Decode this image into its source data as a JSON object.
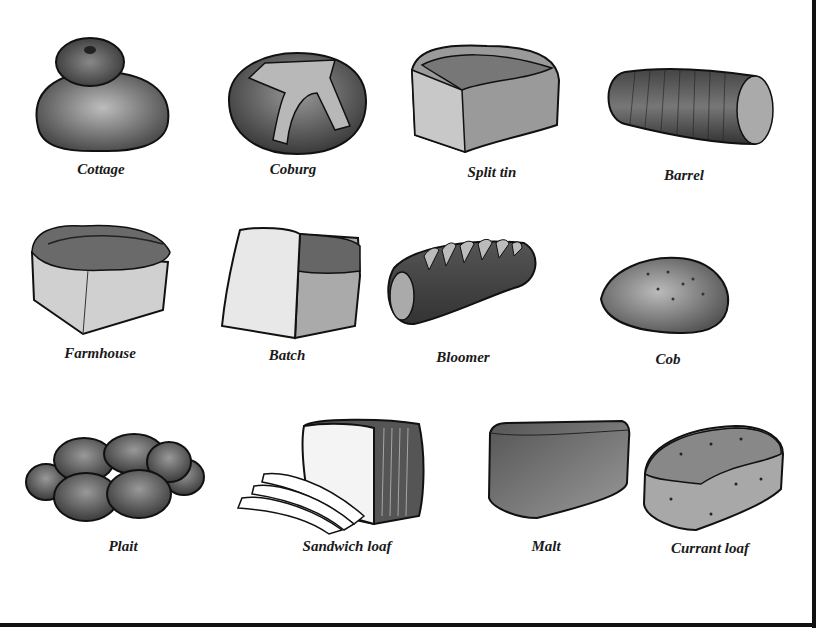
{
  "figure": {
    "rows": [
      {
        "items": [
          {
            "name": "Cottage",
            "icon": "cottage-loaf-icon"
          },
          {
            "name": "Coburg",
            "icon": "coburg-loaf-icon"
          },
          {
            "name": "Split tin",
            "icon": "split-tin-loaf-icon"
          },
          {
            "name": "Barrel",
            "icon": "barrel-loaf-icon"
          }
        ]
      },
      {
        "items": [
          {
            "name": "Farmhouse",
            "icon": "farmhouse-loaf-icon"
          },
          {
            "name": "Batch",
            "icon": "batch-loaf-icon"
          },
          {
            "name": "Bloomer",
            "icon": "bloomer-loaf-icon"
          },
          {
            "name": "Cob",
            "icon": "cob-loaf-icon"
          }
        ]
      },
      {
        "items": [
          {
            "name": "Plait",
            "icon": "plait-loaf-icon"
          },
          {
            "name": "Sandwich loaf",
            "icon": "sandwich-loaf-icon"
          },
          {
            "name": "Malt",
            "icon": "malt-loaf-icon"
          },
          {
            "name": "Currant loaf",
            "icon": "currant-loaf-icon"
          }
        ]
      }
    ]
  },
  "colors": {
    "ink": "#1a1a1a",
    "shade_dark": "#555555",
    "shade_mid": "#8a8a8a",
    "shade_light": "#cfcfcf",
    "background": "#ffffff"
  }
}
